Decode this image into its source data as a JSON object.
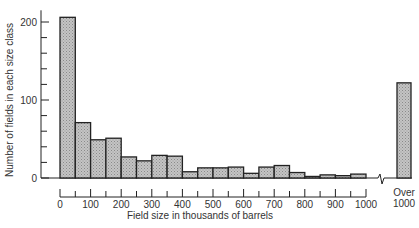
{
  "chart_data": {
    "type": "bar",
    "title": "",
    "xlabel": "Field size in thousands of barrels",
    "ylabel": "Number of fields in each size class",
    "ylim": [
      0,
      220
    ],
    "y_ticks": [
      0,
      100,
      200
    ],
    "x_ticks": [
      "0",
      "100",
      "200",
      "300",
      "400",
      "500",
      "600",
      "700",
      "800",
      "900",
      "1000"
    ],
    "grid": false,
    "legend": null,
    "bin_width": 50,
    "categories": [
      "0-50",
      "50-100",
      "100-150",
      "150-200",
      "200-250",
      "250-300",
      "300-350",
      "350-400",
      "400-450",
      "450-500",
      "500-550",
      "550-600",
      "600-650",
      "650-700",
      "700-750",
      "750-800",
      "800-850",
      "850-900",
      "900-950",
      "950-1000",
      "Over 1000"
    ],
    "values": [
      206,
      71,
      49,
      51,
      27,
      22,
      29,
      28,
      8,
      13,
      13,
      14,
      6,
      14,
      16,
      7,
      2,
      4,
      3,
      5,
      122
    ],
    "overflow_label": [
      "Over",
      "1000"
    ],
    "axis_break": true,
    "bar_fill": "#b5b5b5",
    "bar_stroke": "#222222"
  }
}
